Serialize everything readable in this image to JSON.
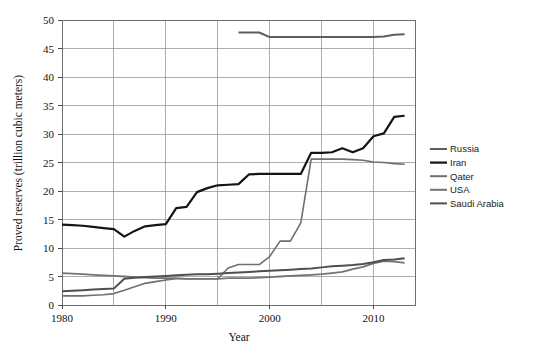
{
  "chart_data": {
    "type": "line",
    "title": "",
    "xlabel": "Year",
    "ylabel": "Proved reserves (trillion cubic meters)",
    "xlim": [
      1980,
      2014
    ],
    "ylim": [
      0,
      50
    ],
    "xticks": [
      1980,
      1990,
      2000,
      2010
    ],
    "xtick_labels": [
      "1980",
      "1990",
      "2000",
      "2010"
    ],
    "yticks": [
      0,
      5,
      10,
      15,
      20,
      25,
      30,
      35,
      40,
      45,
      50
    ],
    "ytick_labels": [
      "0",
      "5",
      "10",
      "15",
      "20",
      "25",
      "30",
      "35",
      "40",
      "45",
      "50"
    ],
    "grid": true,
    "grid_axis": "both",
    "legend_position": "right",
    "series": [
      {
        "name": "Russia",
        "color": "#5e5e5e",
        "width": 2.0,
        "x": [
          1997,
          1998,
          1999,
          2000,
          2001,
          2002,
          2003,
          2004,
          2005,
          2006,
          2007,
          2008,
          2009,
          2010,
          2011,
          2012,
          2013
        ],
        "values": [
          47.8,
          47.8,
          47.8,
          47.0,
          47.0,
          47.0,
          47.0,
          47.0,
          47.0,
          47.0,
          47.0,
          47.0,
          47.0,
          47.0,
          47.1,
          47.4,
          47.5
        ]
      },
      {
        "name": "Iran",
        "color": "#141414",
        "width": 2.2,
        "x": [
          1980,
          1981,
          1982,
          1983,
          1984,
          1985,
          1986,
          1987,
          1988,
          1989,
          1990,
          1991,
          1992,
          1993,
          1994,
          1995,
          1996,
          1997,
          1998,
          1999,
          2000,
          2001,
          2002,
          2003,
          2004,
          2005,
          2006,
          2007,
          2008,
          2009,
          2010,
          2011,
          2012,
          2013
        ],
        "values": [
          14.1,
          14.0,
          13.9,
          13.7,
          13.5,
          13.3,
          12.0,
          13.0,
          13.8,
          14.0,
          14.2,
          17.0,
          17.2,
          19.8,
          20.5,
          21.0,
          21.1,
          21.2,
          22.9,
          23.0,
          23.0,
          23.0,
          23.0,
          23.0,
          26.7,
          26.7,
          26.8,
          27.5,
          26.8,
          27.5,
          29.6,
          30.1,
          33.0,
          33.2
        ]
      },
      {
        "name": "Qater",
        "color": "#6f6f6f",
        "width": 1.6,
        "x": [
          1980,
          1981,
          1982,
          1983,
          1984,
          1985,
          1986,
          1987,
          1988,
          1989,
          1990,
          1991,
          1992,
          1993,
          1994,
          1995,
          1996,
          1997,
          1998,
          1999,
          2000,
          2001,
          2002,
          2003,
          2004,
          2005,
          2006,
          2007,
          2008,
          2009,
          2010,
          2011,
          2012,
          2013
        ],
        "values": [
          1.6,
          1.6,
          1.6,
          1.7,
          1.8,
          2.0,
          2.6,
          3.2,
          3.8,
          4.1,
          4.4,
          4.6,
          4.6,
          4.6,
          4.6,
          4.6,
          6.5,
          7.1,
          7.1,
          7.1,
          8.5,
          11.2,
          11.2,
          14.4,
          25.6,
          25.6,
          25.6,
          25.6,
          25.5,
          25.4,
          25.1,
          25.0,
          24.8,
          24.7
        ]
      },
      {
        "name": "USA",
        "color": "#737373",
        "width": 1.8,
        "x": [
          1980,
          1981,
          1982,
          1983,
          1984,
          1985,
          1986,
          1987,
          1988,
          1989,
          1990,
          1991,
          1992,
          1993,
          1994,
          1995,
          1996,
          1997,
          1998,
          1999,
          2000,
          2001,
          2002,
          2003,
          2004,
          2005,
          2006,
          2007,
          2008,
          2009,
          2010,
          2011,
          2012,
          2013
        ],
        "values": [
          5.6,
          5.5,
          5.4,
          5.3,
          5.2,
          5.1,
          5.0,
          4.9,
          4.8,
          4.7,
          4.7,
          4.7,
          4.6,
          4.6,
          4.6,
          4.6,
          4.7,
          4.7,
          4.7,
          4.8,
          4.9,
          5.0,
          5.1,
          5.2,
          5.3,
          5.4,
          5.6,
          5.8,
          6.3,
          6.7,
          7.3,
          7.7,
          7.6,
          7.4
        ]
      },
      {
        "name": "Saudi Arabia",
        "color": "#4f4f4f",
        "width": 2.0,
        "x": [
          1980,
          1981,
          1982,
          1983,
          1984,
          1985,
          1986,
          1987,
          1988,
          1989,
          1990,
          1991,
          1992,
          1993,
          1994,
          1995,
          1996,
          1997,
          1998,
          1999,
          2000,
          2001,
          2002,
          2003,
          2004,
          2005,
          2006,
          2007,
          2008,
          2009,
          2010,
          2011,
          2012,
          2013
        ],
        "values": [
          2.4,
          2.5,
          2.6,
          2.7,
          2.8,
          2.9,
          4.6,
          4.8,
          4.9,
          5.0,
          5.1,
          5.2,
          5.3,
          5.4,
          5.4,
          5.5,
          5.6,
          5.7,
          5.8,
          5.9,
          6.0,
          6.1,
          6.2,
          6.3,
          6.4,
          6.6,
          6.8,
          6.9,
          7.0,
          7.2,
          7.5,
          7.9,
          8.0,
          8.2
        ]
      }
    ]
  },
  "legend": {
    "entries": [
      {
        "label": "Russia"
      },
      {
        "label": "Iran"
      },
      {
        "label": "Qater"
      },
      {
        "label": "USA"
      },
      {
        "label": "Saudi Arabia"
      }
    ]
  }
}
